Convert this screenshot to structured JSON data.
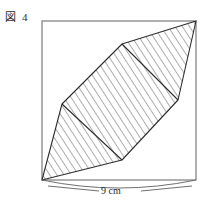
{
  "figure": {
    "label_prefix": "図",
    "label_number": "4",
    "dimension_label": "9 cm",
    "colors": {
      "outline": "#6f6f6f",
      "shape_stroke": "#2e2e2e",
      "hatch": "#4a4a4a",
      "text": "#1f1f1f",
      "background": "#ffffff"
    },
    "square": {
      "left": 42,
      "top": 21,
      "right": 196,
      "bottom": 180,
      "width": 154,
      "height": 159
    },
    "hexagon_vertices": [
      {
        "name": "bottom-left-corner",
        "x": 42,
        "y": 180
      },
      {
        "name": "left-mid",
        "x": 62,
        "y": 104
      },
      {
        "name": "upper-left",
        "x": 122,
        "y": 44
      },
      {
        "name": "top-right-corner",
        "x": 196,
        "y": 21
      },
      {
        "name": "right-mid",
        "x": 178,
        "y": 100
      },
      {
        "name": "lower-right",
        "x": 122,
        "y": 160
      }
    ],
    "chords": [
      {
        "name": "upper-chord",
        "x1": 122,
        "y1": 44,
        "x2": 178,
        "y2": 100
      },
      {
        "name": "lower-chord",
        "x1": 62,
        "y1": 104,
        "x2": 122,
        "y2": 160
      }
    ],
    "hatch": {
      "angle_deg": 33,
      "spacing_px": 6
    },
    "dimension_arc": {
      "x1": 42,
      "y1": 180,
      "x2": 196,
      "y2": 180,
      "sag": 10
    }
  }
}
